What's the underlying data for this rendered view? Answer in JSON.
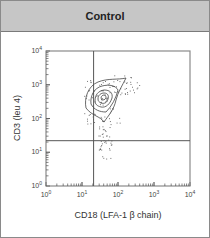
{
  "header": {
    "title": "Control"
  },
  "chart_data": {
    "type": "scatter",
    "subtype": "flow-cytometry-contour-plot",
    "title": "Control",
    "xlabel": "CD18 (LFA-1 β chain)",
    "ylabel": "CD3 (leu 4)",
    "xscale": "log",
    "yscale": "log",
    "xlim": [
      1,
      10000
    ],
    "ylim": [
      1,
      10000
    ],
    "x_ticks": [
      {
        "base": "10",
        "exp": "0"
      },
      {
        "base": "10",
        "exp": "1"
      },
      {
        "base": "10",
        "exp": "2"
      },
      {
        "base": "10",
        "exp": "3"
      },
      {
        "base": "10",
        "exp": "4"
      }
    ],
    "y_ticks": [
      {
        "base": "10",
        "exp": "0"
      },
      {
        "base": "10",
        "exp": "1"
      },
      {
        "base": "10",
        "exp": "2"
      },
      {
        "base": "10",
        "exp": "3"
      },
      {
        "base": "10",
        "exp": "4"
      }
    ],
    "quadrant_gates": {
      "x": 21,
      "y": 22
    },
    "population": {
      "center": {
        "x": 40,
        "y": 320
      },
      "x_range": [
        25,
        300
      ],
      "y_range": [
        30,
        2000
      ],
      "contour_levels": 5,
      "quadrant": "upper-right"
    },
    "grid": false,
    "legend": null
  }
}
